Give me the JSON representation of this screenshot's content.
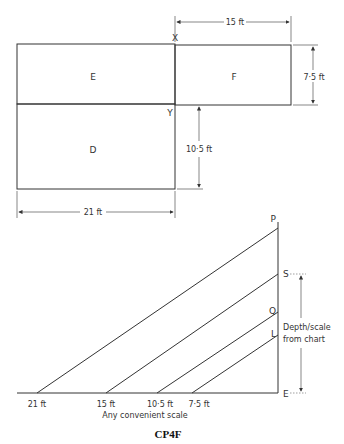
{
  "plan": {
    "rooms": [
      {
        "id": "E",
        "label": "E"
      },
      {
        "id": "F",
        "label": "F"
      },
      {
        "id": "D",
        "label": "D"
      }
    ],
    "points": {
      "X": "X",
      "Y": "Y"
    },
    "dimensions": {
      "f_width": "15 ft",
      "f_height": "7·5 ft",
      "d_height": "10·5 ft",
      "d_width": "21 ft"
    }
  },
  "scale_chart": {
    "points": {
      "P": "P",
      "S": "S",
      "Q": "Q",
      "L": "L",
      "E": "E"
    },
    "base_ticks": [
      "21 ft",
      "15 ft",
      "10·5 ft",
      "7·5 ft"
    ],
    "base_caption": "Any convenient scale",
    "side_label_line1": "Depth/scale",
    "side_label_line2": "from chart"
  },
  "caption": "CP4F",
  "colors": {
    "line": "#333333",
    "dim": "#777777"
  }
}
